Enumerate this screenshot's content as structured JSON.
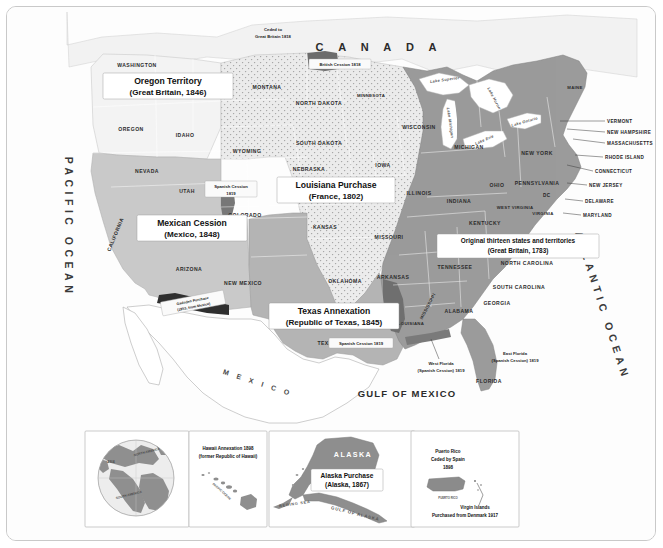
{
  "map": {
    "title": "United States Territorial Acquisitions",
    "country_labels": [
      {
        "name": "canada",
        "text": "C A N A D A"
      },
      {
        "name": "mexico",
        "text": "M E X I C O"
      }
    ],
    "ocean_labels": [
      {
        "name": "pacific-ocean",
        "text": "PACIFIC OCEAN"
      },
      {
        "name": "atlantic-ocean",
        "text": "ATLANTIC OCEAN"
      },
      {
        "name": "gulf-of-mexico",
        "text": "GULF OF MEXICO"
      }
    ],
    "acquisition_boxes": [
      {
        "id": "oregon-territory",
        "title": "Oregon Territory",
        "subtitle": "(Great Britain, 1846)",
        "year": 1846,
        "from": "Great Britain"
      },
      {
        "id": "louisiana-purchase",
        "title": "Louisiana Purchase",
        "subtitle": "(France, 1802)",
        "year": 1802,
        "from": "France"
      },
      {
        "id": "mexican-cession",
        "title": "Mexican Cession",
        "subtitle": "(Mexico, 1848)",
        "year": 1848,
        "from": "Mexico"
      },
      {
        "id": "texas-annexation",
        "title": "Texas Annexation",
        "subtitle": "(Republic of Texas, 1845)",
        "year": 1845,
        "from": "Republic of Texas"
      },
      {
        "id": "original-thirteen",
        "title": "Original thirteen states and territories",
        "subtitle": "(Great Britain, 1783)",
        "year": 1783,
        "from": "Great Britain"
      }
    ],
    "small_annotations": [
      {
        "id": "ceded-to-gb",
        "line1": "Ceded to",
        "line2": "Great Britain 1818"
      },
      {
        "id": "british-cession",
        "line1": "British Cession 1818",
        "line2": ""
      },
      {
        "id": "spanish-cession-west",
        "line1": "Spanish Cession",
        "line2": "1819"
      },
      {
        "id": "spanish-cession-texas",
        "line1": "Spanish Cession 1819",
        "line2": ""
      },
      {
        "id": "gadsden-purchase",
        "line1": "Gadsden Purchase",
        "line2": "(1853, from Mexico)"
      },
      {
        "id": "west-florida",
        "line1": "West Florida",
        "line2": "(Spanish Cession) 1819"
      },
      {
        "id": "east-florida",
        "line1": "East Florida",
        "line2": "(Spanish Cession) 1819"
      }
    ],
    "lakes": [
      "Lake Superior",
      "Lake Huron",
      "Lake Michigan",
      "Lake Erie",
      "Lake Ontario"
    ],
    "states": [
      "WASHINGTON",
      "OREGON",
      "IDAHO",
      "MONTANA",
      "NORTH DAKOTA",
      "MINNESOTA",
      "WISCONSIN",
      "SOUTH DAKOTA",
      "WYOMING",
      "NEVADA",
      "UTAH",
      "COLORADO",
      "NEBRASKA",
      "IOWA",
      "ILLINOIS",
      "MICHIGAN",
      "NEW YORK",
      "PENNSYLVANIA",
      "OHIO",
      "INDIANA",
      "CALIFORNIA",
      "ARIZONA",
      "NEW MEXICO",
      "KANSAS",
      "MISSOURI",
      "KENTUCKY",
      "WEST VIRGINIA",
      "VIRGINIA",
      "OKLAHOMA",
      "ARKANSAS",
      "TENNESSEE",
      "NORTH CAROLINA",
      "SOUTH CAROLINA",
      "TEXAS",
      "LOUISIANA",
      "MISSISSIPPI",
      "ALABAMA",
      "GEORGIA",
      "FLORIDA",
      "MAINE"
    ],
    "callout_states": [
      "VERMONT",
      "NEW HAMPSHIRE",
      "MASSACHUSETTS",
      "RHODE ISLAND",
      "CONNECTICUT",
      "NEW JERSEY",
      "DELAWARE",
      "MARYLAND",
      "DC"
    ]
  },
  "insets": [
    {
      "id": "globe-inset",
      "name": "globe",
      "labels": [
        "ASIA",
        "NORTH AMERICA",
        "SOUTH AMERICA"
      ]
    },
    {
      "id": "hawaii-inset",
      "name": "hawaii",
      "title_line1": "Hawaii Annexation 1898",
      "title_line2": "(former Republic of Hawaii)",
      "sea_label": "PACIFIC OCEAN"
    },
    {
      "id": "alaska-inset",
      "name": "alaska",
      "region_name": "ALASKA",
      "box_line1": "Alaska Purchase",
      "box_line2": "(Alaska, 1867)",
      "sea_labels": [
        "BERING SEA",
        "GULF OF ALASKA"
      ]
    },
    {
      "id": "caribbean-inset",
      "name": "puerto-rico-virgin-islands",
      "pr_line1": "Puerto Rico",
      "pr_line2": "Ceded by Spain",
      "pr_line3": "1898",
      "pr_name": "PUERTO RICO",
      "vi_line1": "Virgin Islands",
      "vi_line2": "Purchased from Denmark 1917"
    }
  ],
  "colors": {
    "original_thirteen": "#9a9a9a",
    "louisiana_purchase": "#e8e8e8",
    "mexican_cession": "#c8c8c8",
    "texas_annexation": "#b0b0b0",
    "oregon_territory": "#efefef",
    "cession_dark": "#6d6d6d",
    "water": "#ffffff",
    "frame": "#c9c9c9"
  }
}
